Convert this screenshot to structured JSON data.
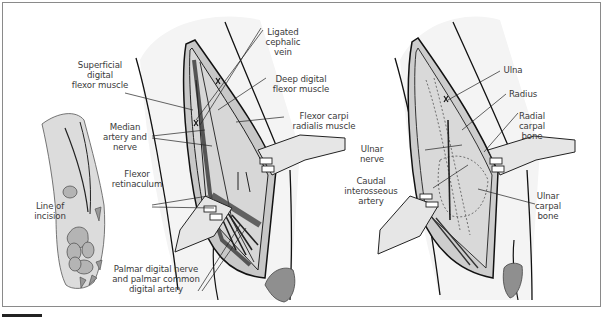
{
  "figure": {
    "panels": [
      {
        "id": "paw",
        "labels": [
          {
            "key": "line_of_incision",
            "text": "Line of\nincision"
          }
        ]
      },
      {
        "id": "superficial_dissection",
        "labels": [
          {
            "key": "ligated_cephalic_vein",
            "text": "Ligated\ncephalic\nvein"
          },
          {
            "key": "superficial_digital_flexor_muscle",
            "text": "Superficial\ndigital\nflexor muscle"
          },
          {
            "key": "deep_digital_flexor_muscle",
            "text": "Deep digital\nflexor muscle"
          },
          {
            "key": "median_artery_and_nerve",
            "text": "Median\nartery and\nnerve"
          },
          {
            "key": "flexor_carpi_radialis_muscle",
            "text": "Flexor carpi\nradialis muscle"
          },
          {
            "key": "flexor_retinaculum",
            "text": "Flexor\nretinaculum"
          },
          {
            "key": "palmar_digital_nerve",
            "text": "Palmar digital nerve\nand palmar common\ndigital artery"
          }
        ]
      },
      {
        "id": "deep_dissection",
        "labels": [
          {
            "key": "ulna",
            "text": "Ulna"
          },
          {
            "key": "radius",
            "text": "Radius"
          },
          {
            "key": "radial_carpal_bone",
            "text": "Radial\ncarpal\nbone"
          },
          {
            "key": "ulnar_nerve",
            "text": "Ulnar\nnerve"
          },
          {
            "key": "caudal_interosseous_artery",
            "text": "Caudal\ninterosseous\nartery"
          },
          {
            "key": "ulnar_carpal_bone",
            "text": "Ulnar\ncarpal\nbone"
          }
        ]
      }
    ],
    "colors": {
      "skin": "#dcdcdc",
      "muscle": "#c4c4c4",
      "dark_muscle": "#5a5a5a",
      "pad": "#a8a8a8",
      "retractor": "#e6e6e6",
      "line": "#1a1a1a",
      "text": "#3a3a3a"
    }
  },
  "labels": {
    "line_of_incision": "Line of\nincision",
    "ligated_cephalic_vein": "Ligated\ncephalic\nvein",
    "superficial_digital_flexor_muscle": "Superficial\ndigital\nflexor muscle",
    "deep_digital_flexor_muscle": "Deep digital\nflexor muscle",
    "median_artery_and_nerve": "Median\nartery and\nnerve",
    "flexor_carpi_radialis_muscle": "Flexor carpi\nradialis muscle",
    "flexor_retinaculum": "Flexor\nretinaculum",
    "palmar_digital_nerve": "Palmar digital nerve\nand palmar common\ndigital artery",
    "ulna": "Ulna",
    "radius": "Radius",
    "radial_carpal_bone": "Radial\ncarpal\nbone",
    "ulnar_nerve": "Ulnar\nnerve",
    "caudal_interosseous_artery": "Caudal\ninterosseous\nartery",
    "ulnar_carpal_bone": "Ulnar\ncarpal\nbone"
  }
}
